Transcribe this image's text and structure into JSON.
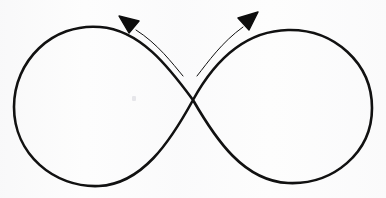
{
  "figure": {
    "description": "A hand-drawn lemniscate (figure-eight / infinity symbol) with two thin curved arrows rising from the central crossing point, one pointing up-left and one pointing up-right.",
    "canvas": {
      "width": 386,
      "height": 198,
      "background_color": "#fdfdfd"
    },
    "ink_color": "#111111",
    "stroke_width_main": 2.6,
    "stroke_width_arrow": 1.0
  },
  "shapes": {
    "lemniscate": {
      "name": "infinity-curve",
      "crossing_point": {
        "x": 193,
        "y": 100
      },
      "left_lobe": {
        "left_edge_x": 13,
        "top_y": 27,
        "bottom_y": 186,
        "center": {
          "x": 103,
          "y": 106
        }
      },
      "right_lobe": {
        "right_edge_x": 372,
        "top_y": 30,
        "bottom_y": 183,
        "center": {
          "x": 283,
          "y": 106
        }
      },
      "path": "M 193 100 C 168 66 140 30 100 27 C 52 23 14 61 14 107 C 14 154 54 188 99 186 C 142 184 170 142 193 100 C 216 58 246 31 288 30 C 334 29 372 63 372 108 C 372 153 333 185 288 183 C 244 181 216 140 193 100 Z"
    },
    "arrow_left": {
      "name": "arrow-up-left",
      "direction": "up-left",
      "tail": {
        "x": 183,
        "y": 76
      },
      "tip": {
        "x": 122,
        "y": 19
      },
      "path": "M 183 76 C 172 63 158 44 136 30",
      "head_points": "119,16 139,21 129,33"
    },
    "arrow_right": {
      "name": "arrow-up-right",
      "direction": "up-right",
      "tail": {
        "x": 197,
        "y": 76
      },
      "tip": {
        "x": 254,
        "y": 15
      },
      "path": "M 197 76 C 208 62 222 42 243 27",
      "head_points": "258,12 238,18 249,30"
    }
  },
  "artifacts": {
    "speck": {
      "x": 132,
      "y": 96,
      "color": "#e2e2e6"
    }
  }
}
